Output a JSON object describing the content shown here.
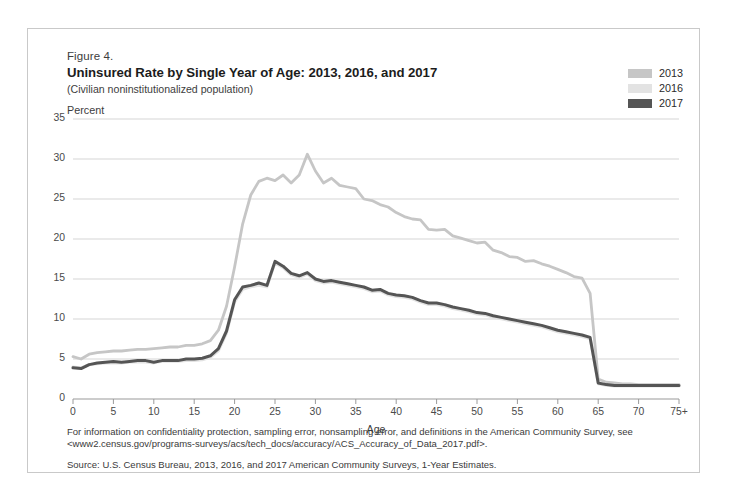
{
  "figure": {
    "number": "Figure 4.",
    "title": "Uninsured Rate by Single Year of Age: 2013, 2016, and 2017",
    "subtitle": "(Civilian noninstitutionalized population)"
  },
  "legend": {
    "position": "top-right",
    "entries": [
      {
        "label": "2013",
        "color": "#c6c6c6"
      },
      {
        "label": "2016",
        "color": "#e3e3e3"
      },
      {
        "label": "2017",
        "color": "#555555"
      }
    ]
  },
  "footer": {
    "note": "For information on confidentiality protection, sampling error, nonsampling error, and definitions in the American Community Survey, see <www2.census.gov/programs-surveys/acs/tech_docs/accuracy/ACS_Accuracy_of_Data_2017.pdf>.",
    "source": "Source: U.S. Census Bureau, 2013, 2016, and 2017 American Community Surveys, 1-Year Estimates."
  },
  "chart_data": {
    "type": "line",
    "title": "Uninsured Rate by Single Year of Age: 2013, 2016, and 2017",
    "subtitle": "(Civilian noninstitutionalized population)",
    "xlabel": "Age",
    "ylabel": "Percent",
    "ylim": [
      0,
      35
    ],
    "xlim": [
      0,
      75
    ],
    "grid": true,
    "y_ticks": [
      0,
      5,
      10,
      15,
      20,
      25,
      30,
      35
    ],
    "x_ticks": [
      0,
      5,
      10,
      15,
      20,
      25,
      30,
      35,
      40,
      45,
      50,
      55,
      60,
      65,
      70,
      75
    ],
    "x_tick_labels": [
      "0",
      "5",
      "10",
      "15",
      "20",
      "25",
      "30",
      "35",
      "40",
      "45",
      "50",
      "55",
      "60",
      "65",
      "70",
      "75+"
    ],
    "x": [
      0,
      1,
      2,
      3,
      4,
      5,
      6,
      7,
      8,
      9,
      10,
      11,
      12,
      13,
      14,
      15,
      16,
      17,
      18,
      19,
      20,
      21,
      22,
      23,
      24,
      25,
      26,
      27,
      28,
      29,
      30,
      31,
      32,
      33,
      34,
      35,
      36,
      37,
      38,
      39,
      40,
      41,
      42,
      43,
      44,
      45,
      46,
      47,
      48,
      49,
      50,
      51,
      52,
      53,
      54,
      55,
      56,
      57,
      58,
      59,
      60,
      61,
      62,
      63,
      64,
      65,
      66,
      67,
      68,
      69,
      70,
      71,
      72,
      73,
      74,
      75
    ],
    "series": [
      {
        "name": "2013",
        "color": "#c6c6c6",
        "values": [
          5.3,
          5.0,
          5.6,
          5.8,
          5.9,
          6.0,
          6.0,
          6.1,
          6.2,
          6.2,
          6.3,
          6.4,
          6.5,
          6.5,
          6.7,
          6.7,
          6.9,
          7.3,
          8.6,
          11.6,
          16.5,
          21.9,
          25.5,
          27.2,
          27.6,
          27.3,
          28.0,
          27.0,
          28.0,
          30.6,
          28.5,
          27.0,
          27.6,
          26.7,
          26.5,
          26.3,
          25.0,
          24.8,
          24.3,
          24.0,
          23.3,
          22.8,
          22.5,
          22.4,
          21.2,
          21.1,
          21.2,
          20.4,
          20.1,
          19.8,
          19.5,
          19.6,
          18.6,
          18.3,
          17.8,
          17.7,
          17.2,
          17.3,
          16.9,
          16.6,
          16.2,
          15.8,
          15.3,
          15.1,
          13.2,
          2.5,
          2.1,
          2.0,
          1.9,
          1.9,
          1.8,
          1.8,
          1.8,
          1.8,
          1.8,
          1.8
        ]
      },
      {
        "name": "2016",
        "color": "#e3e3e3",
        "values": [
          4.0,
          3.9,
          4.3,
          4.4,
          4.5,
          4.5,
          4.5,
          4.6,
          4.6,
          4.6,
          4.5,
          4.7,
          4.7,
          4.7,
          4.8,
          4.8,
          4.9,
          5.2,
          6.0,
          8.2,
          12.1,
          13.7,
          14.0,
          14.2,
          14.0,
          17.0,
          16.4,
          15.5,
          15.2,
          15.6,
          14.8,
          14.5,
          14.6,
          14.4,
          14.2,
          14.0,
          13.8,
          13.4,
          13.5,
          13.0,
          12.8,
          12.7,
          12.5,
          12.1,
          11.8,
          11.8,
          11.6,
          11.3,
          11.1,
          10.9,
          10.6,
          10.5,
          10.2,
          10.0,
          9.8,
          9.6,
          9.4,
          9.2,
          9.0,
          8.7,
          8.4,
          8.2,
          8.0,
          7.8,
          7.5,
          1.9,
          1.7,
          1.6,
          1.6,
          1.6,
          1.6,
          1.6,
          1.6,
          1.6,
          1.6,
          1.6
        ]
      },
      {
        "name": "2017",
        "color": "#555555",
        "values": [
          3.9,
          3.8,
          4.3,
          4.5,
          4.6,
          4.7,
          4.6,
          4.7,
          4.8,
          4.8,
          4.6,
          4.8,
          4.8,
          4.8,
          5.0,
          5.0,
          5.1,
          5.4,
          6.3,
          8.5,
          12.4,
          14.0,
          14.2,
          14.5,
          14.2,
          17.2,
          16.6,
          15.7,
          15.4,
          15.8,
          15.0,
          14.7,
          14.8,
          14.6,
          14.4,
          14.2,
          14.0,
          13.6,
          13.7,
          13.2,
          13.0,
          12.9,
          12.7,
          12.3,
          12.0,
          12.0,
          11.8,
          11.5,
          11.3,
          11.1,
          10.8,
          10.7,
          10.4,
          10.2,
          10.0,
          9.8,
          9.6,
          9.4,
          9.2,
          8.9,
          8.6,
          8.4,
          8.2,
          8.0,
          7.7,
          2.0,
          1.8,
          1.7,
          1.7,
          1.7,
          1.7,
          1.7,
          1.7,
          1.7,
          1.7,
          1.7
        ]
      }
    ]
  }
}
